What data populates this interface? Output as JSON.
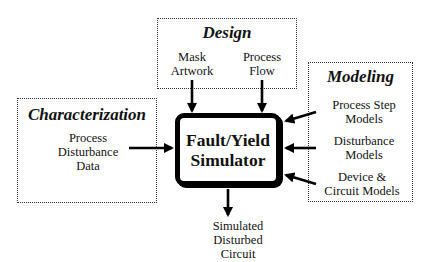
{
  "diagram": {
    "center": {
      "title_line1": "Fault/Yield",
      "title_line2": "Simulator"
    },
    "design": {
      "title": "Design",
      "inputs": [
        {
          "line1": "Mask",
          "line2": "Artwork"
        },
        {
          "line1": "Process",
          "line2": "Flow"
        }
      ]
    },
    "characterization": {
      "title": "Characterization",
      "inputs": [
        {
          "line1": "Process",
          "line2": "Disturbance",
          "line3": "Data"
        }
      ]
    },
    "modeling": {
      "title": "Modeling",
      "inputs": [
        {
          "line1": "Process Step",
          "line2": "Models"
        },
        {
          "line1": "Disturbance",
          "line2": "Models"
        },
        {
          "line1": "Device &",
          "line2": "Circuit Models"
        }
      ]
    },
    "output": {
      "line1": "Simulated",
      "line2": "Disturbed",
      "line3": "Circuit"
    },
    "colors": {
      "stroke": "#000000",
      "group_border": "#333333",
      "background": "#ffffff"
    }
  }
}
